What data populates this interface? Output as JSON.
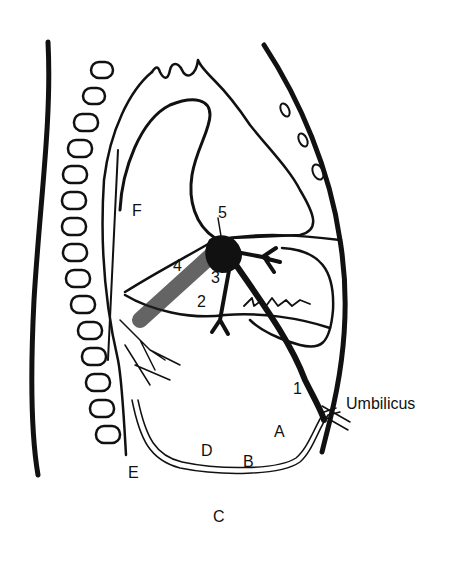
{
  "diagram": {
    "type": "anatomical sagittal section",
    "labels": {
      "F": "F",
      "n5": "5",
      "n4": "4",
      "n3": "3",
      "n2": "2",
      "n1": "1",
      "umbilicus": "Umbilicus",
      "A": "A",
      "B": "B",
      "C": "C",
      "D": "D",
      "E": "E"
    },
    "colors": {
      "ink": "#111111",
      "background": "#ffffff"
    }
  }
}
